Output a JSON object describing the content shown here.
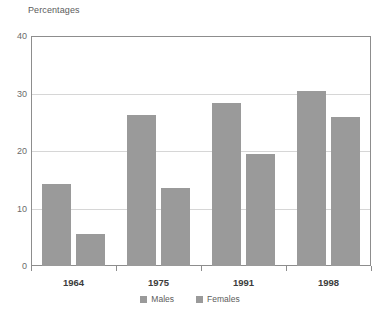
{
  "chart_data": {
    "type": "bar",
    "title": "Percentages",
    "xlabel": "",
    "ylabel": "",
    "ylim": [
      0,
      40
    ],
    "yticks": [
      0,
      10,
      20,
      30,
      40
    ],
    "grid": true,
    "legend_position": "bottom",
    "categories": [
      "1964",
      "1975",
      "1991",
      "1998"
    ],
    "series": [
      {
        "name": "Males",
        "color": "#9a9a9a",
        "values": [
          14.3,
          26.2,
          28.4,
          30.4
        ]
      },
      {
        "name": "Females",
        "color": "#9a9a9a",
        "values": [
          5.5,
          13.5,
          19.5,
          26.0
        ]
      }
    ]
  },
  "axis": {
    "tick_0": "0",
    "tick_10": "10",
    "tick_20": "20",
    "tick_30": "30",
    "tick_40": "40"
  },
  "legend": {
    "males_label": "Males",
    "females_label": "Females"
  },
  "colors": {
    "bar": "#9a9a9a",
    "frame": "#8d8d8d",
    "grid": "#d6d6d6",
    "background": "#ffffff",
    "title_text": "#5c5c5c",
    "xlabel_text": "#3c3c3c"
  }
}
